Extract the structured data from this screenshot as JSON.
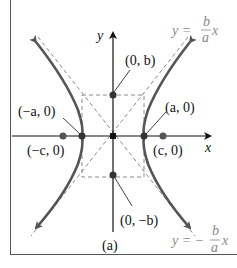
{
  "figure": {
    "caption": "(a)",
    "axes": {
      "x_label": "x",
      "y_label": "y"
    },
    "points": {
      "vertex_left": "(−a, 0)",
      "vertex_right": "(a, 0)",
      "focus_left": "(−c, 0)",
      "focus_right": "(c, 0)",
      "co_vertex_top": "(0, b)",
      "co_vertex_bottom": "(0, −b)"
    },
    "asymptotes": {
      "positive": {
        "lhs": "y =",
        "num": "b",
        "den": "a",
        "rhs": "x"
      },
      "negative": {
        "lhs": "y = −",
        "num": "b",
        "den": "a",
        "rhs": "x"
      }
    },
    "colors": {
      "curve": "#555555",
      "axis": "#111111",
      "dashed": "#8a8a8a",
      "asymptote_label": "#8a8a8a",
      "frame": "#555555"
    }
  }
}
